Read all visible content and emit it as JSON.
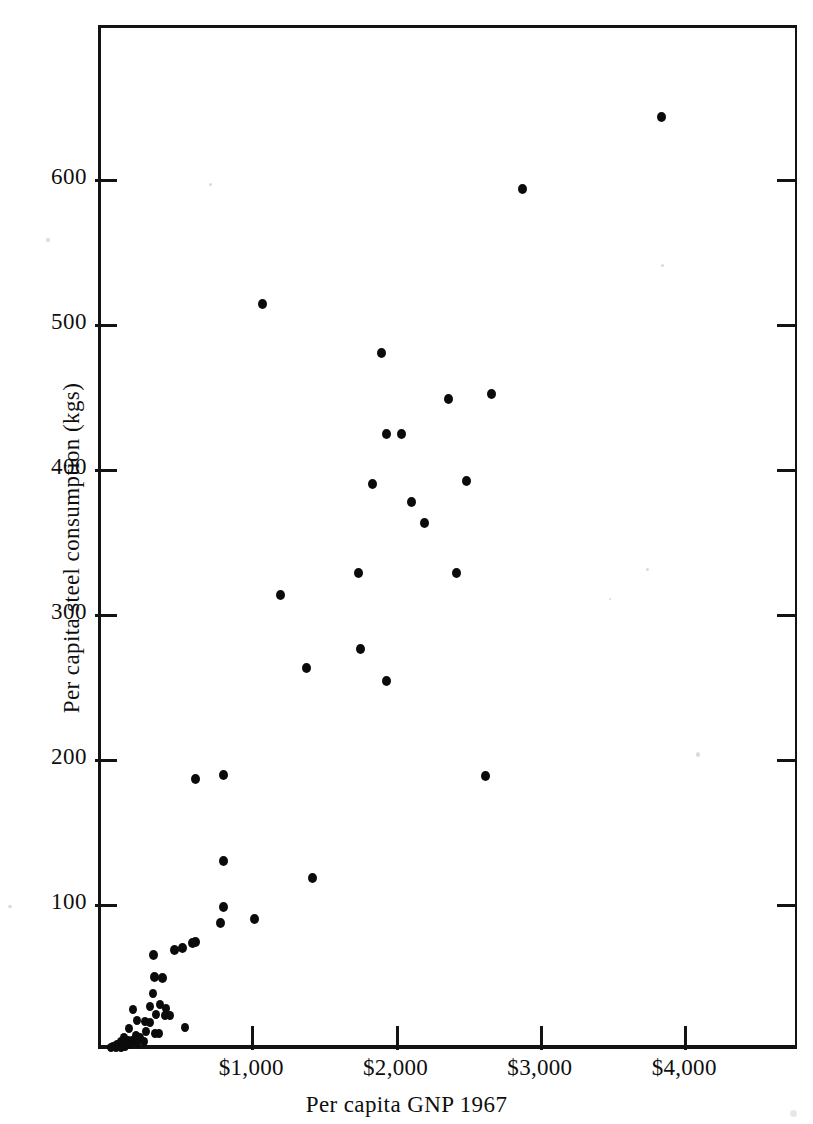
{
  "figure": {
    "background": "#ffffff",
    "ink": "#0b0b0b"
  },
  "axes": {
    "x_title": "Per capita GNP 1967",
    "y_title": "Per capita steel consumption (kgs)",
    "x_tick_labels": [
      "$1,000",
      "$2,000",
      "$3,000",
      "$4,000"
    ],
    "y_tick_labels": [
      "600",
      "500",
      "400",
      "300",
      "200",
      "100"
    ]
  },
  "chart_data": {
    "type": "scatter",
    "title": "",
    "xlabel": "Per capita GNP 1967",
    "ylabel": "Per capita steel consumption (kgs)",
    "xlim": [
      0,
      4840
    ],
    "ylim": [
      0,
      707
    ],
    "xticks": [
      1000,
      2000,
      3000,
      4000
    ],
    "xticklabels": [
      "$1,000",
      "$2,000",
      "$3,000",
      "$4,000"
    ],
    "yticks": [
      100,
      200,
      300,
      400,
      500,
      600
    ],
    "yticklabels": [
      "100",
      "200",
      "300",
      "400",
      "500",
      "600"
    ],
    "grid": false,
    "legend": null,
    "marker": "filled-circle",
    "marker_color": "#0b0b0b",
    "points": [
      {
        "x": 3845,
        "y": 643
      },
      {
        "x": 2880,
        "y": 593
      },
      {
        "x": 1075,
        "y": 514
      },
      {
        "x": 1900,
        "y": 480
      },
      {
        "x": 2665,
        "y": 452
      },
      {
        "x": 2365,
        "y": 448
      },
      {
        "x": 1935,
        "y": 424
      },
      {
        "x": 2040,
        "y": 424
      },
      {
        "x": 2490,
        "y": 392
      },
      {
        "x": 1840,
        "y": 390
      },
      {
        "x": 2110,
        "y": 377
      },
      {
        "x": 2200,
        "y": 363
      },
      {
        "x": 2425,
        "y": 328
      },
      {
        "x": 1745,
        "y": 328
      },
      {
        "x": 1200,
        "y": 313
      },
      {
        "x": 1755,
        "y": 276
      },
      {
        "x": 1385,
        "y": 263
      },
      {
        "x": 1940,
        "y": 254
      },
      {
        "x": 2620,
        "y": 188
      },
      {
        "x": 810,
        "y": 189
      },
      {
        "x": 610,
        "y": 186
      },
      {
        "x": 810,
        "y": 130
      },
      {
        "x": 1425,
        "y": 118
      },
      {
        "x": 810,
        "y": 98
      },
      {
        "x": 1020,
        "y": 90
      },
      {
        "x": 790,
        "y": 87
      },
      {
        "x": 610,
        "y": 74
      },
      {
        "x": 590,
        "y": 73
      },
      {
        "x": 525,
        "y": 70
      },
      {
        "x": 470,
        "y": 68
      },
      {
        "x": 325,
        "y": 65
      },
      {
        "x": 330,
        "y": 50
      },
      {
        "x": 385,
        "y": 49
      },
      {
        "x": 320,
        "y": 38
      },
      {
        "x": 365,
        "y": 31
      },
      {
        "x": 300,
        "y": 29
      },
      {
        "x": 410,
        "y": 28
      },
      {
        "x": 180,
        "y": 27
      },
      {
        "x": 340,
        "y": 24
      },
      {
        "x": 400,
        "y": 23
      },
      {
        "x": 440,
        "y": 23
      },
      {
        "x": 205,
        "y": 20
      },
      {
        "x": 260,
        "y": 19
      },
      {
        "x": 300,
        "y": 18
      },
      {
        "x": 540,
        "y": 15
      },
      {
        "x": 150,
        "y": 14
      },
      {
        "x": 270,
        "y": 12
      },
      {
        "x": 335,
        "y": 11
      },
      {
        "x": 360,
        "y": 11
      },
      {
        "x": 200,
        "y": 9
      },
      {
        "x": 230,
        "y": 8
      },
      {
        "x": 115,
        "y": 8
      },
      {
        "x": 145,
        "y": 6
      },
      {
        "x": 175,
        "y": 6
      },
      {
        "x": 255,
        "y": 5
      },
      {
        "x": 95,
        "y": 5
      },
      {
        "x": 130,
        "y": 4
      },
      {
        "x": 205,
        "y": 4
      },
      {
        "x": 70,
        "y": 3
      },
      {
        "x": 110,
        "y": 3
      },
      {
        "x": 160,
        "y": 3
      },
      {
        "x": 45,
        "y": 2
      },
      {
        "x": 85,
        "y": 2
      },
      {
        "x": 125,
        "y": 2
      },
      {
        "x": 30,
        "y": 1
      },
      {
        "x": 60,
        "y": 1
      },
      {
        "x": 100,
        "y": 1
      }
    ]
  }
}
